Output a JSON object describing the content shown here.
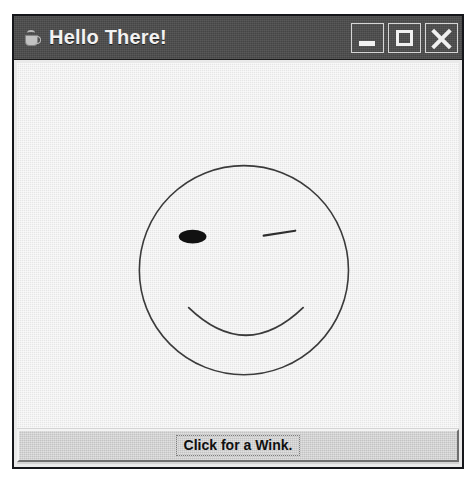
{
  "window": {
    "title": "Hello There!",
    "icon": "java-coffee-cup-icon",
    "frame_color": "#15161a",
    "titlebar_color": "#4c4c4c",
    "title_text_color": "#f2f2f2",
    "client_background": "#ececec",
    "controls": [
      {
        "name": "minimize",
        "glyph": "_",
        "tooltip": "Minimize"
      },
      {
        "name": "maximize",
        "glyph": "□",
        "tooltip": "Maximize"
      },
      {
        "name": "close",
        "glyph": "✕",
        "tooltip": "Close"
      }
    ]
  },
  "canvas": {
    "description": "Winking smiley face line drawing",
    "stroke_color": "#3a3a3a",
    "fill_color": "#111111",
    "face": {
      "shape": "circle",
      "center_x": 226,
      "center_y": 210,
      "radius": 106
    },
    "left_eye": {
      "shape": "filled-ellipse",
      "center_x": 174,
      "center_y": 176,
      "radius_x": 14,
      "radius_y": 7
    },
    "right_eye": {
      "shape": "line-wink",
      "x1": 246,
      "y1": 175,
      "x2": 278,
      "y2": 170
    },
    "mouth": {
      "shape": "arc-smile",
      "x1": 170,
      "y1": 248,
      "x2": 286,
      "y2": 248,
      "dip_y": 288
    }
  },
  "bottom_panel": {
    "button": {
      "label": "Click for a Wink.",
      "focused": true,
      "background": "#cfcfcf",
      "text_color": "#101010"
    }
  }
}
